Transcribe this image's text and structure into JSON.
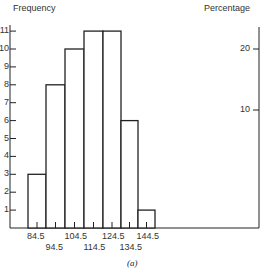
{
  "chart_data": {
    "type": "bar",
    "title": "",
    "caption": "(a)",
    "ylabel": "Frequency",
    "ylabel_right": "Percentage",
    "xlabel": "",
    "categories": [
      "84.5",
      "94.5",
      "104.5",
      "114.5",
      "124.5",
      "134.5",
      "144.5"
    ],
    "bin_edges_note": "class boundaries",
    "values": [
      3,
      8,
      10,
      11,
      11,
      6,
      1
    ],
    "ylim": [
      0,
      11
    ],
    "yticks": [
      1,
      2,
      3,
      4,
      5,
      6,
      7,
      8,
      9,
      10,
      11
    ],
    "right_axis": {
      "label": "Percentage",
      "ticks": [
        10,
        20
      ]
    },
    "grid": false,
    "legend": null
  },
  "labels": {
    "y_left_title": "Frequency",
    "y_right_title": "Percentage",
    "caption": "(a)",
    "x_upper": [
      "84.5",
      "104.5",
      "124.5",
      "144.5"
    ],
    "x_lower": [
      "94.5",
      "114.5",
      "134.5"
    ],
    "y_ticks": [
      "1",
      "2",
      "3",
      "4",
      "5",
      "6",
      "7",
      "8",
      "9",
      "10",
      "11"
    ],
    "right_ticks": [
      "10",
      "20"
    ]
  }
}
